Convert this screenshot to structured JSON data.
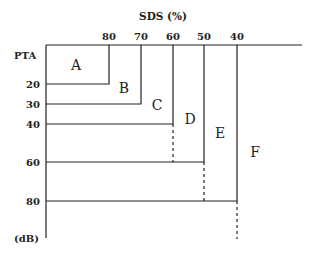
{
  "diagram": {
    "x_axis_title": "SDS (%)",
    "y_axis_title": "PTA",
    "y_unit": "(dB)",
    "sds_ticks": [
      {
        "label": "80",
        "x": 109
      },
      {
        "label": "70",
        "x": 141
      },
      {
        "label": "60",
        "x": 173
      },
      {
        "label": "50",
        "x": 204
      },
      {
        "label": "40",
        "x": 237
      }
    ],
    "pta_ticks": [
      {
        "label": "20",
        "y": 84
      },
      {
        "label": "30",
        "y": 104
      },
      {
        "label": "40",
        "y": 124
      },
      {
        "label": "60",
        "y": 162
      },
      {
        "label": "80",
        "y": 201
      }
    ],
    "regions": [
      {
        "label": "A",
        "sds_max": "80",
        "pta_max": "20"
      },
      {
        "label": "B",
        "sds_max": "70",
        "pta_max": "30"
      },
      {
        "label": "C",
        "sds_max": "60",
        "pta_max": "40"
      },
      {
        "label": "D",
        "sds_max": "50",
        "pta_max": "60"
      },
      {
        "label": "E",
        "sds_max": "40",
        "pta_max": "80"
      },
      {
        "label": "F",
        "sds_max": "",
        "pta_max": ""
      }
    ],
    "line_color": "#222222"
  }
}
